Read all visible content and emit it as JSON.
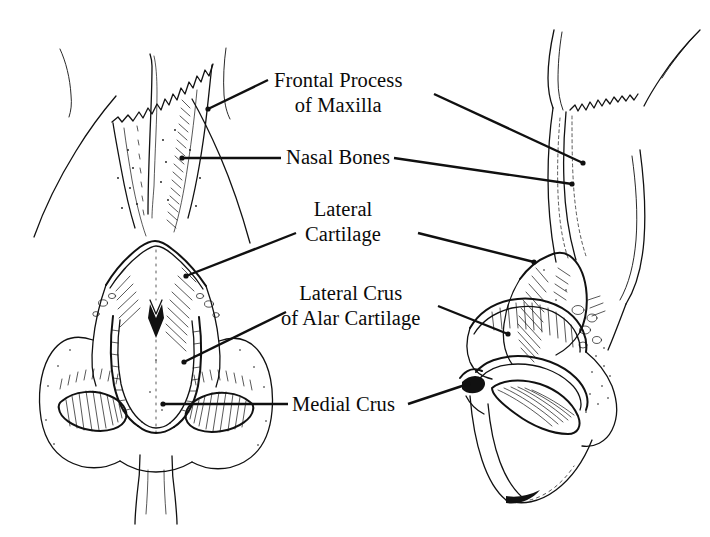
{
  "figure": {
    "background_color": "#ffffff",
    "ink_color": "#111111",
    "width": 710,
    "height": 537,
    "style": "pen-and-ink medical illustration, stippled and hatched line art",
    "views": [
      {
        "name": "frontal-view",
        "description": "Anterior view of the nasal pyramid showing nasal bones, lateral cartilages and alar cartilages"
      },
      {
        "name": "lateral-view",
        "description": "Oblique right lateral view of the nose showing the same structures in profile"
      }
    ]
  },
  "labels": [
    {
      "id": "frontal-process",
      "line1": "Frontal Process",
      "line2": "of Maxilla",
      "leaders": 2
    },
    {
      "id": "nasal-bones",
      "line1": "Nasal Bones",
      "line2": "",
      "leaders": 2
    },
    {
      "id": "lateral-cartilage",
      "line1": "Lateral",
      "line2": "Cartilage",
      "leaders": 2
    },
    {
      "id": "lateral-crus",
      "line1": "Lateral Crus",
      "line2": "of Alar Cartilage",
      "leaders": 2
    },
    {
      "id": "medial-crus",
      "line1": "Medial Crus",
      "line2": "",
      "leaders": 2
    }
  ]
}
